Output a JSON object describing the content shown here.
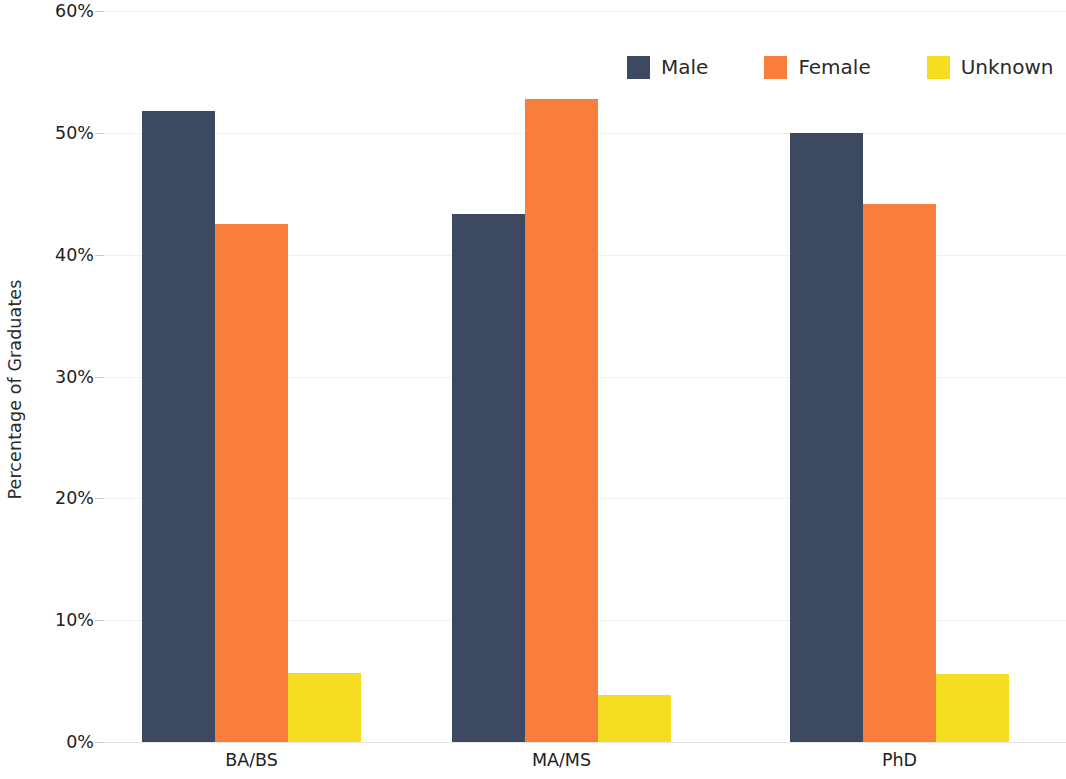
{
  "chart_data": {
    "type": "bar",
    "title": "",
    "subtitle": "",
    "xlabel": "",
    "ylabel": "Percentage of Graduates",
    "categories": [
      "BA/BS",
      "MA/MS",
      "PhD"
    ],
    "series": [
      {
        "name": "Male",
        "color": "#3d4960",
        "values": [
          51.8,
          43.3,
          50.0
        ]
      },
      {
        "name": "Female",
        "color": "#f97e3d",
        "values": [
          42.5,
          52.8,
          44.2
        ]
      },
      {
        "name": "Unknown",
        "color": "#f5de21",
        "values": [
          5.7,
          3.9,
          5.6
        ]
      }
    ],
    "ylim": [
      0,
      60
    ],
    "y_tick_values": [
      0,
      10,
      20,
      30,
      40,
      50,
      60
    ],
    "y_tick_labels": [
      "0%",
      "10%",
      "20%",
      "30%",
      "40%",
      "50%",
      "60%"
    ],
    "y_tick_suffix": "%",
    "grid": true,
    "grid_axis": "y",
    "legend_position": "top-right",
    "legend_orientation": "horizontal",
    "background_color": "#ffffff",
    "bar_group_gap": true
  },
  "legend": {
    "items": [
      {
        "label": "Male",
        "swatch_color": "#3d4960",
        "icon": "square-swatch-icon"
      },
      {
        "label": "Female",
        "swatch_color": "#f97e3d",
        "icon": "square-swatch-icon"
      },
      {
        "label": "Unknown",
        "swatch_color": "#f5de21",
        "icon": "square-swatch-icon"
      }
    ]
  },
  "axes": {
    "y_title": "Percentage of Graduates",
    "y_labels": [
      "60%",
      "50%",
      "40%",
      "30%",
      "20%",
      "10%",
      "0%"
    ],
    "x_labels": [
      "BA/BS",
      "MA/MS",
      "PhD"
    ]
  }
}
